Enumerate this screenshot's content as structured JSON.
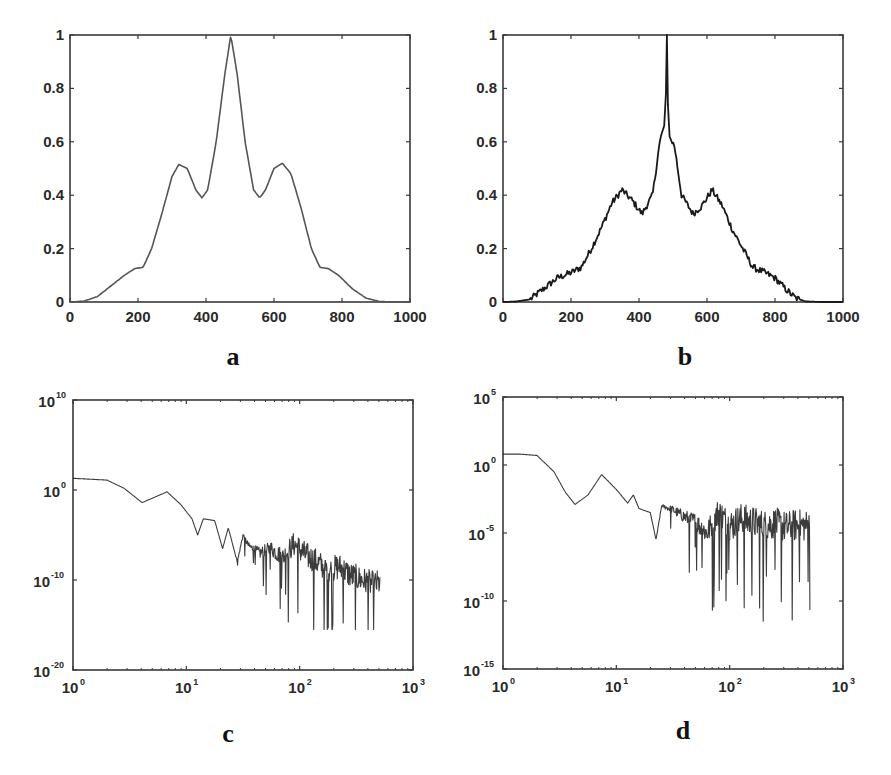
{
  "figure": {
    "panel_labels": [
      "a",
      "b",
      "c",
      "d"
    ],
    "colors": {
      "axes": "#3a3a3a",
      "line_smooth": "#555555",
      "line_noisy": "#1a1a1a",
      "background": "#ffffff"
    }
  },
  "chart_data": [
    {
      "id": "a",
      "type": "line",
      "title": "",
      "panel_label": "a",
      "xlabel": "",
      "ylabel": "",
      "xscale": "linear",
      "yscale": "linear",
      "xlim": [
        0,
        1000
      ],
      "ylim": [
        0,
        1
      ],
      "xticks": [
        0,
        200,
        400,
        600,
        800,
        1000
      ],
      "xtick_labels": [
        "0",
        "200",
        "400",
        "600",
        "800",
        "1000"
      ],
      "yticks": [
        0,
        0.2,
        0.4,
        0.6,
        0.8,
        1
      ],
      "ytick_labels": [
        "0",
        "0.2",
        "0.4",
        "0.6",
        "0.8",
        "1"
      ],
      "grid": false,
      "legend": null,
      "series": [
        {
          "name": "profile",
          "x": [
            0,
            40,
            80,
            120,
            160,
            190,
            215,
            240,
            270,
            300,
            320,
            345,
            370,
            388,
            405,
            430,
            455,
            473,
            492,
            515,
            540,
            558,
            575,
            600,
            625,
            650,
            680,
            710,
            735,
            760,
            790,
            830,
            870,
            910,
            960,
            1000
          ],
          "y": [
            0,
            0.003,
            0.02,
            0.06,
            0.1,
            0.125,
            0.13,
            0.2,
            0.33,
            0.47,
            0.515,
            0.5,
            0.42,
            0.39,
            0.42,
            0.6,
            0.85,
            1.0,
            0.85,
            0.6,
            0.42,
            0.39,
            0.42,
            0.5,
            0.52,
            0.48,
            0.35,
            0.2,
            0.13,
            0.125,
            0.1,
            0.05,
            0.015,
            0.002,
            0,
            0
          ]
        }
      ]
    },
    {
      "id": "b",
      "type": "line",
      "title": "",
      "panel_label": "b",
      "xlabel": "",
      "ylabel": "",
      "xscale": "linear",
      "yscale": "linear",
      "xlim": [
        0,
        1000
      ],
      "ylim": [
        0,
        1
      ],
      "xticks": [
        0,
        200,
        400,
        600,
        800,
        1000
      ],
      "xtick_labels": [
        "0",
        "200",
        "400",
        "600",
        "800",
        "1000"
      ],
      "yticks": [
        0,
        0.2,
        0.4,
        0.6,
        0.8,
        1
      ],
      "ytick_labels": [
        "0",
        "0.2",
        "0.4",
        "0.6",
        "0.8",
        "1"
      ],
      "grid": false,
      "legend": null,
      "series": [
        {
          "name": "noisy profile",
          "x": [
            0,
            40,
            80,
            120,
            160,
            200,
            230,
            260,
            290,
            320,
            350,
            380,
            409,
            440,
            460,
            472,
            478,
            482,
            486,
            492,
            505,
            525,
            559,
            585,
            615,
            645,
            675,
            705,
            735,
            770,
            800,
            830,
            860,
            890,
            940,
            1000
          ],
          "y": [
            0,
            0.002,
            0.01,
            0.05,
            0.09,
            0.11,
            0.13,
            0.2,
            0.28,
            0.37,
            0.42,
            0.38,
            0.33,
            0.4,
            0.59,
            0.66,
            0.75,
            1.0,
            0.72,
            0.62,
            0.58,
            0.4,
            0.33,
            0.36,
            0.42,
            0.36,
            0.27,
            0.2,
            0.13,
            0.11,
            0.09,
            0.05,
            0.015,
            0.002,
            0,
            0
          ]
        }
      ],
      "notes": "Curve has small high-frequency noise along its entire length; sharp spike to 1.0 at center (~482)."
    },
    {
      "id": "c",
      "type": "line",
      "title": "",
      "panel_label": "c",
      "xlabel": "",
      "ylabel": "",
      "xscale": "log",
      "yscale": "log",
      "xlim": [
        1,
        1000
      ],
      "ylim": [
        1e-20,
        10000000000.0
      ],
      "xticks": [
        1,
        10,
        100,
        1000
      ],
      "xtick_labels": [
        {
          "base": "10",
          "exp": "0"
        },
        {
          "base": "10",
          "exp": "1"
        },
        {
          "base": "10",
          "exp": "2"
        },
        {
          "base": "10",
          "exp": "3"
        }
      ],
      "yticks": [
        10000000000.0,
        1,
        1e-10,
        1e-20
      ],
      "ytick_labels": [
        {
          "base": "10",
          "exp": "10"
        },
        {
          "base": "10",
          "exp": "0"
        },
        {
          "base": "10",
          "exp": "-10"
        },
        {
          "base": "10",
          "exp": "-20"
        }
      ],
      "grid": false,
      "legend": null,
      "series": [
        {
          "name": "spectrum",
          "log10_x": [
            0,
            0.15,
            0.3,
            0.45,
            0.61,
            0.72,
            0.83,
            0.95,
            1.05,
            1.1,
            1.15,
            1.25,
            1.32,
            1.37,
            1.45,
            1.5,
            1.55,
            1.65,
            1.75,
            1.85,
            1.95,
            2.05,
            2.15,
            2.25,
            2.35,
            2.45,
            2.55,
            2.65,
            2.71
          ],
          "log10_y": [
            1.3,
            1.2,
            1.1,
            0.2,
            -1.4,
            -0.8,
            -0.2,
            -1.6,
            -3.2,
            -5.0,
            -3.2,
            -3.4,
            -6.5,
            -4.2,
            -8.0,
            -5.0,
            -6.2,
            -7.0,
            -6.5,
            -7.5,
            -6.0,
            -7.2,
            -8.0,
            -9.0,
            -8.5,
            -9.5,
            -10.0,
            -10.5,
            -10.3
          ],
          "noise_envelope_log10": {
            "start_log10_x": 1.4,
            "amplitude_decades": 2.5,
            "deepest_dip_log10_y": -15.5
          }
        }
      ]
    },
    {
      "id": "d",
      "type": "line",
      "title": "",
      "panel_label": "d",
      "xlabel": "",
      "ylabel": "",
      "xscale": "log",
      "yscale": "log",
      "xlim": [
        1,
        1000
      ],
      "ylim": [
        1e-15,
        100000.0
      ],
      "xticks": [
        1,
        10,
        100,
        1000
      ],
      "xtick_labels": [
        {
          "base": "10",
          "exp": "0"
        },
        {
          "base": "10",
          "exp": "1"
        },
        {
          "base": "10",
          "exp": "2"
        },
        {
          "base": "10",
          "exp": "3"
        }
      ],
      "yticks": [
        100000.0,
        1,
        1e-05,
        1e-10,
        1e-15
      ],
      "ytick_labels": [
        {
          "base": "10",
          "exp": "5"
        },
        {
          "base": "10",
          "exp": "0"
        },
        {
          "base": "10",
          "exp": "-5"
        },
        {
          "base": "10",
          "exp": "-10"
        },
        {
          "base": "10",
          "exp": "-15"
        }
      ],
      "grid": false,
      "legend": null,
      "series": [
        {
          "name": "spectrum",
          "log10_x": [
            0,
            0.15,
            0.3,
            0.45,
            0.55,
            0.635,
            0.75,
            0.87,
            1.0,
            1.1,
            1.15,
            1.2,
            1.3,
            1.35,
            1.4,
            1.5,
            1.6,
            1.7,
            1.8,
            1.9,
            2.0,
            2.1,
            2.2,
            2.3,
            2.4,
            2.5,
            2.6,
            2.71
          ],
          "log10_y": [
            0.8,
            0.8,
            0.7,
            -0.5,
            -2.0,
            -2.9,
            -2.2,
            -0.7,
            -1.8,
            -2.8,
            -2.2,
            -3.2,
            -3.5,
            -5.5,
            -3.0,
            -3.3,
            -3.8,
            -4.2,
            -5.0,
            -3.5,
            -4.5,
            -4.0,
            -4.2,
            -4.5,
            -4.3,
            -4.6,
            -4.4,
            -4.5
          ],
          "noise_envelope_log10": {
            "start_log10_x": 1.35,
            "amplitude_decades": 2.0,
            "deepest_dip_log10_y": -12.0
          }
        }
      ]
    }
  ]
}
